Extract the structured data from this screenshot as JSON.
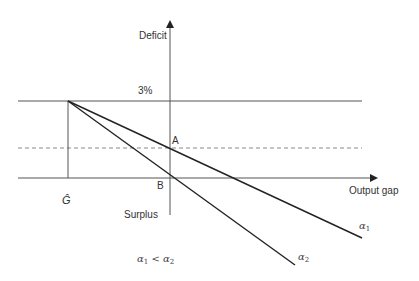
{
  "diagram": {
    "title": "",
    "axes": {
      "y_label_top": "Deficit",
      "y_label_bottom": "Surplus",
      "x_label": "Output gap"
    },
    "labels": {
      "threshold": "3%",
      "point_a": "A",
      "point_b": "B",
      "g_hat": "Ĝ",
      "line1": "α",
      "line1_sub": "1",
      "line2": "α",
      "line2_sub": "2",
      "relation_a": "α",
      "relation_a_sub": "1",
      "relation_op": " < ",
      "relation_b": "α",
      "relation_b_sub": "2"
    },
    "colors": {
      "axis": "#555555",
      "line": "#222222",
      "dashed": "#888888",
      "text": "#333333"
    }
  }
}
